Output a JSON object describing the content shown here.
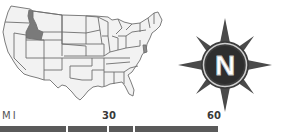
{
  "map": {
    "title": "United States locator map",
    "highlighted_state": "Idaho",
    "colors": {
      "state_fill": "#f2f2f2",
      "state_border": "#6e6e6e",
      "highlight_fill": "#7a7a7a"
    }
  },
  "compass": {
    "letter": "N",
    "colors": {
      "ring": "#3c3c3c",
      "letter": "#ffffff",
      "points": "#4a4a4a"
    }
  },
  "scale": {
    "unit": "MI",
    "labels": [
      "30",
      "60"
    ],
    "bar_color": "#5a5a5a"
  }
}
